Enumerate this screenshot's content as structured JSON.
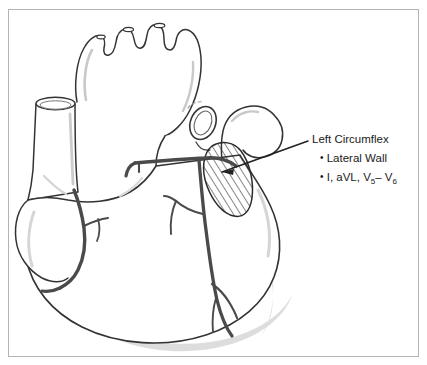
{
  "figure": {
    "title_text": "Left Circumflex",
    "bullets": [
      {
        "marker": "•",
        "text": "Lateral Wall"
      },
      {
        "marker": "•",
        "lead_prefix": "I, aVL, V",
        "lead_sub_1": "5",
        "lead_dash": "– V",
        "lead_sub_2": "6"
      }
    ],
    "colors": {
      "frame": "#b3b3b3",
      "outline": "#333333",
      "artery": "#4a4a4a",
      "hatch": "#2b2b2b",
      "shadow": "#d8d8d8",
      "text": "#1a1a1a",
      "background": "#ffffff"
    },
    "anatomy_labels": {
      "aortic_arch": "aortic-arch",
      "superior_vena_cava": "superior-vena-cava",
      "pulmonary_trunk": "pulmonary-trunk",
      "left_atrial_appendage": "left-atrial-appendage",
      "right_atrial_appendage": "right-atrial-appendage",
      "left_ventricle": "left-ventricle",
      "right_ventricle": "right-ventricle",
      "circumflex_artery": "circumflex-artery",
      "left_anterior_descending": "left-anterior-descending-artery",
      "right_coronary_artery": "right-coronary-artery",
      "infarct_territory": "hatched-lateral-wall-territory"
    }
  }
}
